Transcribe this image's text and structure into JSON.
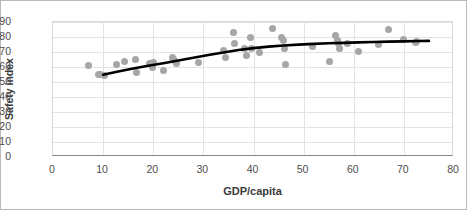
{
  "chart_data": {
    "type": "scatter",
    "title": "",
    "xlabel": "GDP/capita",
    "ylabel": "Safety index",
    "xlim": [
      0,
      80
    ],
    "ylim": [
      0,
      90
    ],
    "xticks": [
      0,
      10,
      20,
      30,
      40,
      50,
      60,
      70,
      80
    ],
    "yticks": [
      0,
      10,
      20,
      30,
      40,
      50,
      60,
      70,
      80,
      90
    ],
    "grid": true,
    "legend": "none",
    "marker_color": "#a6a6a6",
    "trendline_color": "#000000",
    "points": [
      {
        "x": 7.0,
        "y": 60.8
      },
      {
        "x": 9.0,
        "y": 55.3
      },
      {
        "x": 9.5,
        "y": 55.0
      },
      {
        "x": 10.3,
        "y": 54.2
      },
      {
        "x": 12.7,
        "y": 61.8
      },
      {
        "x": 14.3,
        "y": 63.6
      },
      {
        "x": 16.4,
        "y": 64.8
      },
      {
        "x": 16.6,
        "y": 56.6
      },
      {
        "x": 19.2,
        "y": 62.3
      },
      {
        "x": 19.9,
        "y": 60.0
      },
      {
        "x": 20.1,
        "y": 62.8
      },
      {
        "x": 22.1,
        "y": 57.4
      },
      {
        "x": 23.8,
        "y": 66.1
      },
      {
        "x": 24.1,
        "y": 65.0
      },
      {
        "x": 24.3,
        "y": 64.2
      },
      {
        "x": 24.6,
        "y": 62.6
      },
      {
        "x": 29.1,
        "y": 63.1
      },
      {
        "x": 34.1,
        "y": 71.0
      },
      {
        "x": 34.4,
        "y": 66.1
      },
      {
        "x": 36.1,
        "y": 83.0
      },
      {
        "x": 36.3,
        "y": 75.5
      },
      {
        "x": 38.2,
        "y": 72.6
      },
      {
        "x": 38.6,
        "y": 67.9
      },
      {
        "x": 39.4,
        "y": 79.4
      },
      {
        "x": 39.6,
        "y": 72.4
      },
      {
        "x": 41.2,
        "y": 69.8
      },
      {
        "x": 43.8,
        "y": 86.0
      },
      {
        "x": 45.6,
        "y": 79.8
      },
      {
        "x": 46.0,
        "y": 77.8
      },
      {
        "x": 46.2,
        "y": 72.6
      },
      {
        "x": 46.4,
        "y": 61.9
      },
      {
        "x": 51.7,
        "y": 73.6
      },
      {
        "x": 55.1,
        "y": 64.0
      },
      {
        "x": 56.4,
        "y": 80.8
      },
      {
        "x": 56.7,
        "y": 77.8
      },
      {
        "x": 56.9,
        "y": 75.5
      },
      {
        "x": 57.1,
        "y": 72.2
      },
      {
        "x": 58.8,
        "y": 75.8
      },
      {
        "x": 61.0,
        "y": 70.2
      },
      {
        "x": 65.0,
        "y": 75.2
      },
      {
        "x": 66.9,
        "y": 85.0
      },
      {
        "x": 69.9,
        "y": 78.5
      },
      {
        "x": 72.4,
        "y": 76.6
      },
      {
        "x": 72.6,
        "y": 77.3
      }
    ],
    "trendline": [
      {
        "x": 10.0,
        "y": 54.8
      },
      {
        "x": 13.0,
        "y": 57.0
      },
      {
        "x": 16.0,
        "y": 59.0
      },
      {
        "x": 19.0,
        "y": 60.8
      },
      {
        "x": 22.0,
        "y": 62.5
      },
      {
        "x": 25.0,
        "y": 64.3
      },
      {
        "x": 28.0,
        "y": 66.2
      },
      {
        "x": 31.0,
        "y": 68.0
      },
      {
        "x": 34.0,
        "y": 69.7
      },
      {
        "x": 37.0,
        "y": 71.3
      },
      {
        "x": 40.0,
        "y": 72.6
      },
      {
        "x": 43.0,
        "y": 73.6
      },
      {
        "x": 46.0,
        "y": 74.3
      },
      {
        "x": 49.0,
        "y": 74.9
      },
      {
        "x": 52.0,
        "y": 75.4
      },
      {
        "x": 55.0,
        "y": 75.8
      },
      {
        "x": 58.0,
        "y": 76.1
      },
      {
        "x": 61.0,
        "y": 76.4
      },
      {
        "x": 64.0,
        "y": 76.7
      },
      {
        "x": 67.0,
        "y": 76.9
      },
      {
        "x": 70.0,
        "y": 77.1
      },
      {
        "x": 73.0,
        "y": 77.3
      },
      {
        "x": 75.0,
        "y": 77.4
      }
    ]
  }
}
